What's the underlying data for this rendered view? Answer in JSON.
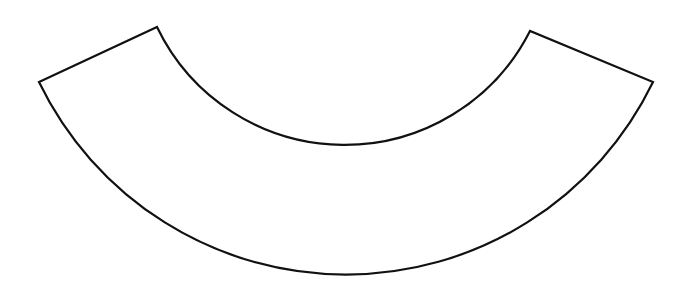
{
  "figure": {
    "type": "annular-sector",
    "stroke_color": "#111111",
    "fill_color": "#ffffff",
    "stroke_width": 2.2,
    "center": [
      346,
      -65
    ],
    "inner_radius": 208,
    "outer_radius": 341,
    "corners": {
      "inner_left": [
        157,
        27
      ],
      "outer_left": [
        39,
        82
      ],
      "inner_right": [
        530,
        31
      ],
      "outer_right": [
        653,
        82
      ]
    }
  }
}
